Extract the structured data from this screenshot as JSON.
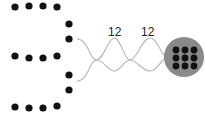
{
  "diagram": {
    "type": "twisted-pair-illustration",
    "colors": {
      "dot": "#111111",
      "wire": "#b4b4b4",
      "bundle_circle": "#8a8a8a",
      "label": "#222222"
    },
    "dot_rows": [
      {
        "y": 7,
        "xs": [
          15,
          29,
          43,
          57
        ]
      },
      {
        "y": 56,
        "xs": [
          15,
          29,
          43,
          57
        ]
      },
      {
        "y": 107,
        "xs": [
          15,
          29,
          43,
          57
        ]
      }
    ],
    "side_dots": [
      {
        "x": 69,
        "y": 24
      },
      {
        "x": 69,
        "y": 39
      },
      {
        "x": 69,
        "y": 75
      },
      {
        "x": 69,
        "y": 90
      }
    ],
    "twist_labels": [
      {
        "text": "12",
        "x": 115,
        "y": 36
      },
      {
        "text": "12",
        "x": 150,
        "y": 36
      }
    ],
    "bundle": {
      "cx": 184,
      "cy": 57,
      "r": 20,
      "inner_grid": {
        "rows": 3,
        "cols": 3
      }
    }
  }
}
